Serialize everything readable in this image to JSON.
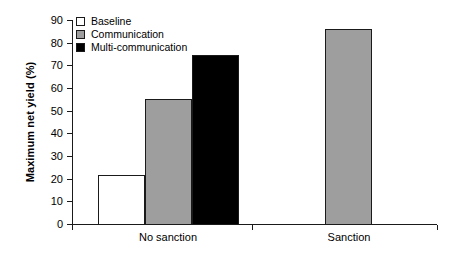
{
  "chart_data": {
    "type": "bar",
    "title": "",
    "subtitle": "",
    "xlabel": "",
    "ylabel": "Maximum net yield (%)",
    "categories": [
      "No sanction",
      "Sanction"
    ],
    "series": [
      {
        "name": "Baseline",
        "color": "#ffffff",
        "values": [
          21.5,
          null
        ]
      },
      {
        "name": "Communication",
        "color": "#9e9e9e",
        "values": [
          55,
          86
        ]
      },
      {
        "name": "Multi-communication",
        "color": "#000000",
        "values": [
          74.5,
          null
        ]
      }
    ],
    "ylim": [
      0,
      90
    ],
    "yticks": [
      0,
      10,
      20,
      30,
      40,
      50,
      60,
      70,
      80,
      90
    ],
    "ytick_labels": [
      "0",
      "10",
      "20",
      "30",
      "40",
      "50",
      "60",
      "70",
      "80",
      "90"
    ],
    "grid": false,
    "legend_position": "top-left",
    "legend_entries": [
      "Baseline",
      "Communication",
      "Multi-communication"
    ]
  },
  "axis": {
    "y_title": "Maximum net yield (%)",
    "ticks": [
      {
        "label": "90"
      },
      {
        "label": "80"
      },
      {
        "label": "70"
      },
      {
        "label": "60"
      },
      {
        "label": "50"
      },
      {
        "label": "40"
      },
      {
        "label": "30"
      },
      {
        "label": "20"
      },
      {
        "label": "10"
      },
      {
        "label": "0"
      }
    ],
    "groups": [
      {
        "label": "No sanction"
      },
      {
        "label": "Sanction"
      }
    ]
  },
  "legend": {
    "items": [
      {
        "label": "Baseline",
        "swatch": "legend-swatch-baseline"
      },
      {
        "label": "Communication",
        "swatch": "legend-swatch-communication"
      },
      {
        "label": "Multi-communication",
        "swatch": "legend-swatch-multi-communication"
      }
    ]
  },
  "bars": [
    {
      "name": "bar-no-sanction-baseline",
      "group": "No sanction",
      "series": "Baseline",
      "value": 21.5
    },
    {
      "name": "bar-no-sanction-communication",
      "group": "No sanction",
      "series": "Communication",
      "value": 55
    },
    {
      "name": "bar-no-sanction-multi-communication",
      "group": "No sanction",
      "series": "Multi-communication",
      "value": 74.5
    },
    {
      "name": "bar-sanction-communication",
      "group": "Sanction",
      "series": "Communication",
      "value": 86
    }
  ]
}
